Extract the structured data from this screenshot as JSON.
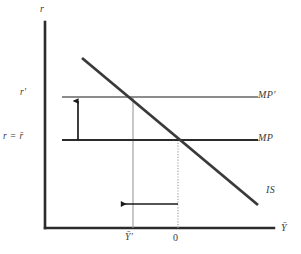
{
  "figure": {
    "type": "economics-diagram",
    "name": "IS-MP diagram with monetary tightening",
    "axes": {
      "y_axis_label": "r",
      "x_axis_label": "Ȳ",
      "y_axis_color": "#2b2b2b",
      "x_axis_color": "#2b2b2b"
    },
    "y_axis_ticks": [
      {
        "id": "r-prime",
        "label": "r′",
        "y": 97
      },
      {
        "id": "r-eq-rbar",
        "label": "r = r̄",
        "y": 140
      }
    ],
    "x_axis_ticks": [
      {
        "id": "ybar-prime",
        "label": "Ȳ′",
        "x": 133
      },
      {
        "id": "zero",
        "label": "0",
        "x": 178
      }
    ],
    "curves": [
      {
        "id": "mp-prime",
        "label": "MP′",
        "color": "#8c8c8c",
        "kind": "horizontal",
        "y": 97,
        "x1": 62,
        "x2": 258
      },
      {
        "id": "mp",
        "label": "MP",
        "color": "#2b2b2b",
        "kind": "horizontal",
        "y": 140,
        "x1": 62,
        "x2": 258
      },
      {
        "id": "is",
        "label": "IS",
        "color": "#3a3a3a",
        "kind": "downward-sloping",
        "x1": 82,
        "y1": 58,
        "x2": 258,
        "y2": 205
      }
    ],
    "guides": [
      {
        "id": "guide-ybar-prime",
        "kind": "vertical-solid",
        "x": 133,
        "y1": 97,
        "y2": 228,
        "color": "#9a9a9a"
      },
      {
        "id": "guide-zero",
        "kind": "vertical-dotted",
        "x": 178,
        "y1": 140,
        "y2": 228,
        "color": "#9a9a9a"
      }
    ],
    "arrows": [
      {
        "id": "shift-up-arrow",
        "direction": "up",
        "x": 78,
        "y_from": 140,
        "y_to": 100,
        "color": "#1a1a1a",
        "meaning": "MP shifts up from r = r̄ to r′"
      },
      {
        "id": "shift-left-arrow",
        "direction": "left",
        "y": 204,
        "x_from": 178,
        "x_to": 120,
        "color": "#1a1a1a",
        "meaning": "output falls from 0 to Ȳ′"
      }
    ],
    "colors": {
      "background": "#ffffff",
      "ink": "#2b2b2b",
      "gray_line": "#8c8c8c",
      "guide_gray": "#9a9a9a"
    }
  }
}
